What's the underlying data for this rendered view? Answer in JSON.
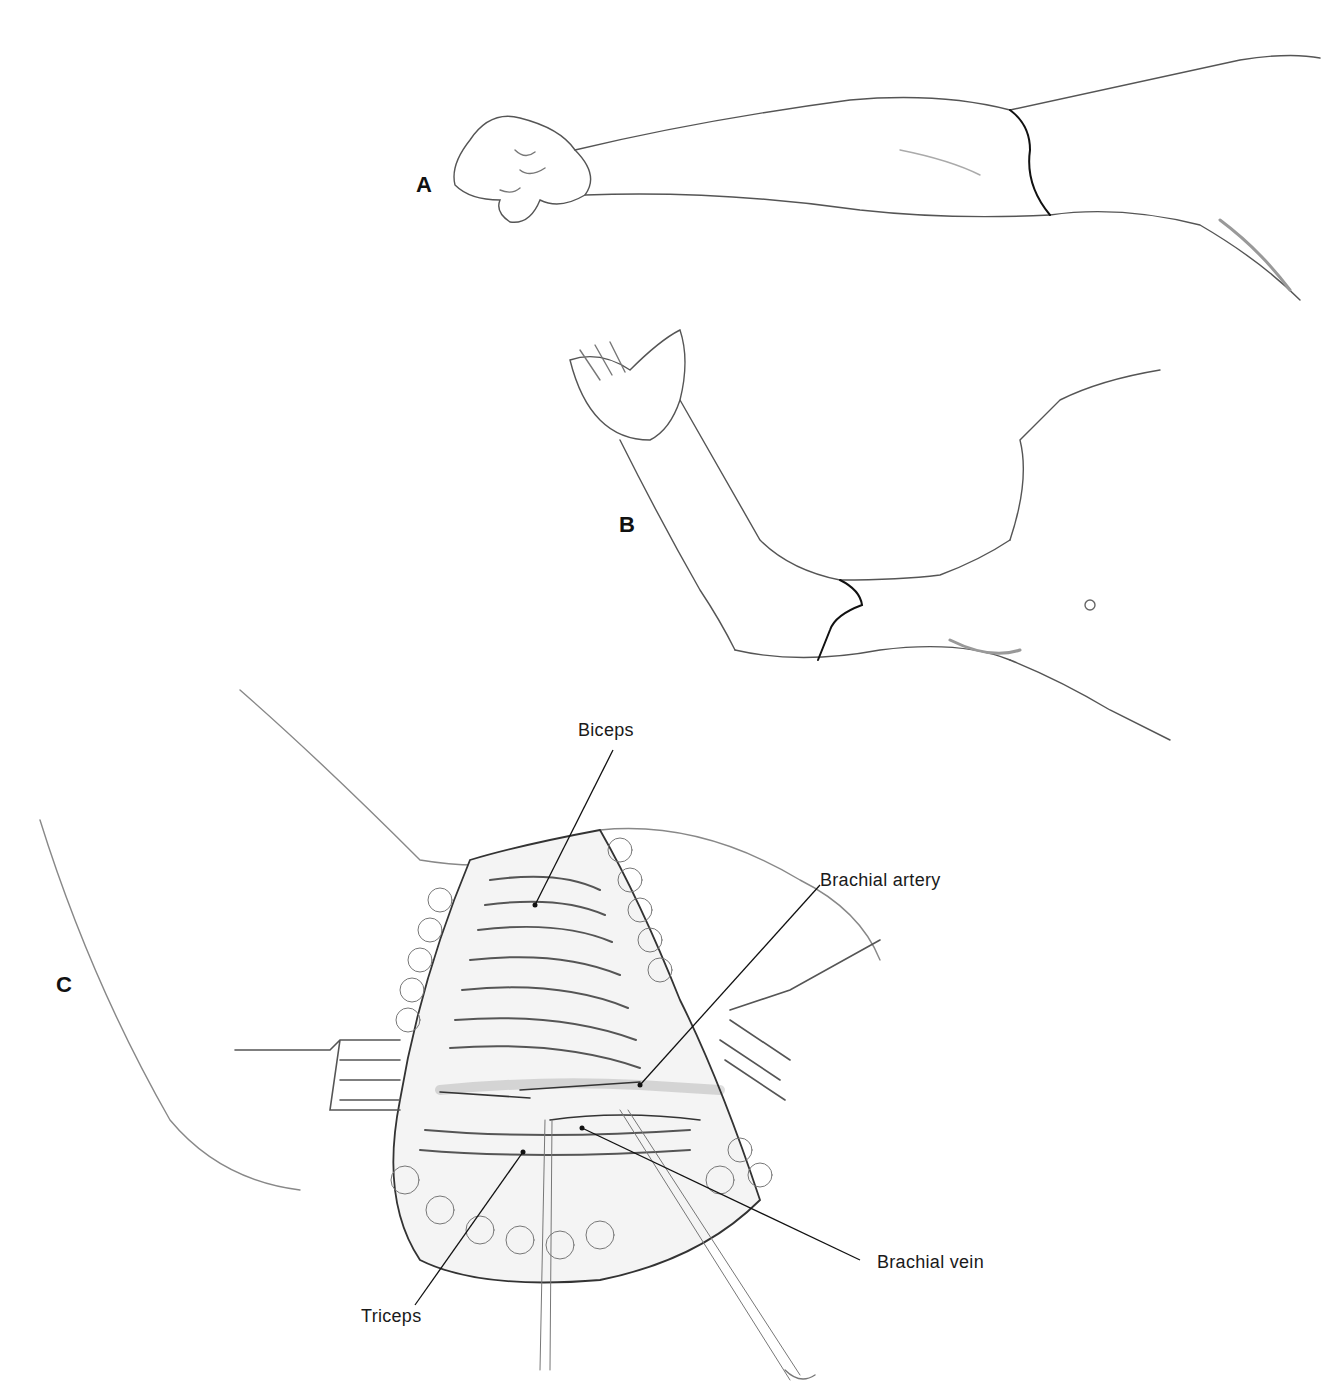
{
  "figure": {
    "panels": [
      {
        "id": "A",
        "label": "A",
        "description": "Arm extended with fist, incision line on upper arm"
      },
      {
        "id": "B",
        "label": "B",
        "description": "Arm abducted with palm up, incision line on medial upper arm"
      },
      {
        "id": "C",
        "label": "C",
        "description": "Surgical exposure with retractors showing brachial vessels"
      }
    ],
    "callouts": {
      "biceps": "Biceps",
      "brachial_artery": "Brachial artery",
      "brachial_vein": "Brachial vein",
      "triceps": "Triceps"
    },
    "colors": {
      "background": "#ffffff",
      "ink": "#1a1a1a",
      "shading": "#8a8a8a",
      "light_shading": "#c8c8c8"
    }
  }
}
